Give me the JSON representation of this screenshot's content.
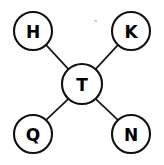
{
  "diagram": {
    "background_color": "#ffffff",
    "stroke_color": "#101010",
    "edge_color": "#151515",
    "label_color": "#000000",
    "canvas": {
      "width": 164,
      "height": 165
    },
    "center_node": {
      "id": "T",
      "label": "T",
      "cx": 82,
      "cy": 84,
      "r": 20
    },
    "outer_nodes": [
      {
        "id": "H",
        "label": "H",
        "cx": 33,
        "cy": 31,
        "r": 19,
        "position": "top-left"
      },
      {
        "id": "K",
        "label": "K",
        "cx": 131,
        "cy": 31,
        "r": 19,
        "position": "top-right"
      },
      {
        "id": "Q",
        "label": "Q",
        "cx": 33,
        "cy": 134,
        "r": 19,
        "position": "bottom-left"
      },
      {
        "id": "N",
        "label": "N",
        "cx": 131,
        "cy": 134,
        "r": 19,
        "position": "bottom-right"
      }
    ],
    "edges": [
      {
        "from": "T",
        "to": "H",
        "x1": 68.4,
        "y1": 69.2,
        "x2": 46.7,
        "y2": 45.6
      },
      {
        "from": "T",
        "to": "K",
        "x1": 95.6,
        "y1": 69.2,
        "x2": 117.3,
        "y2": 45.6
      },
      {
        "from": "T",
        "to": "Q",
        "x1": 68.4,
        "y1": 98.8,
        "x2": 46.7,
        "y2": 119.4
      },
      {
        "from": "T",
        "to": "N",
        "x1": 95.6,
        "y1": 98.8,
        "x2": 117.3,
        "y2": 119.4
      }
    ]
  }
}
